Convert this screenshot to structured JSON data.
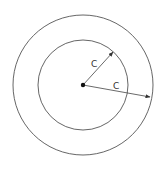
{
  "diagram": {
    "type": "concentric-circles",
    "center": {
      "x": 83,
      "y": 85
    },
    "inner_circle": {
      "radius": 45
    },
    "outer_circle": {
      "radius": 70
    },
    "center_point": {
      "radius": 2
    },
    "arrows": [
      {
        "name": "inner-radius-arrow",
        "from": {
          "x": 83,
          "y": 85
        },
        "to": {
          "x": 113,
          "y": 52
        },
        "label": "C",
        "label_pos": {
          "x": 91,
          "y": 67
        }
      },
      {
        "name": "outer-radius-arrow",
        "from": {
          "x": 83,
          "y": 85
        },
        "to": {
          "x": 150,
          "y": 97
        },
        "label": "C",
        "label_pos": {
          "x": 113,
          "y": 89
        }
      }
    ],
    "colors": {
      "stroke": "#555555",
      "dot": "#111111",
      "background": "#ffffff"
    }
  },
  "labels": {
    "inner_c": "C",
    "outer_c": "C"
  }
}
